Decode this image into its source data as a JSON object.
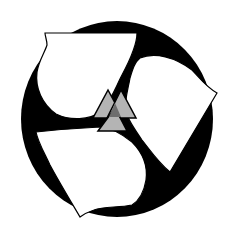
{
  "figure": {
    "colors": {
      "background": "#ffffff",
      "ring": "#000000",
      "segments": "#ffffff",
      "triangle_fill": "#b4b4b4",
      "triangle_overlap": "#6e6e6e",
      "outline": "#000000"
    }
  }
}
